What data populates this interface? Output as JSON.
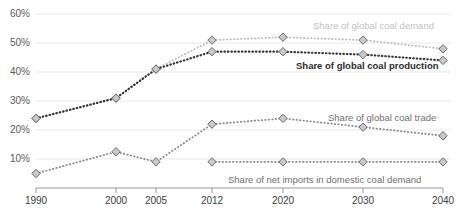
{
  "chart_data": {
    "type": "line",
    "title": "",
    "subtitle": "",
    "xlabel": "",
    "ylabel": "",
    "x": [
      "1990",
      "2000",
      "2005",
      "2012",
      "2020",
      "2030",
      "2040"
    ],
    "categories": [
      "1990",
      "2000",
      "2005",
      "2012",
      "2020",
      "2030",
      "2040"
    ],
    "ylim": [
      0,
      62
    ],
    "yticks": [
      10,
      20,
      30,
      40,
      50,
      60
    ],
    "ytick_labels": [
      "10%",
      "20%",
      "30%",
      "40%",
      "50%",
      "60%"
    ],
    "grid": "horizontal",
    "legend_position": "inline-annotations",
    "series": [
      {
        "name": "Share of global coal demand",
        "color": "#bfbfbf",
        "label_color": "#c2c2c2",
        "bold": false,
        "values": [
          24,
          31,
          41,
          51,
          52,
          51,
          48
        ],
        "x": [
          "1990",
          "2000",
          "2005",
          "2012",
          "2020",
          "2030",
          "2040"
        ]
      },
      {
        "name": "Share of global coal production",
        "color": "#333333",
        "label_color": "#2b2b2b",
        "bold": true,
        "values": [
          24,
          31,
          41,
          47,
          47,
          46,
          44
        ],
        "x": [
          "1990",
          "2000",
          "2005",
          "2012",
          "2020",
          "2030",
          "2040"
        ]
      },
      {
        "name": "Share of global coal trade",
        "color": "#8a8a8a",
        "label_color": "#6f6f6f",
        "bold": false,
        "values": [
          5,
          12.5,
          9,
          22,
          24,
          21,
          18
        ],
        "x": [
          "1990",
          "2000",
          "2005",
          "2012",
          "2020",
          "2030",
          "2040"
        ]
      },
      {
        "name": "Share of net imports in domestic coal demand",
        "color": "#8a8a8a",
        "label_color": "#6f6f6f",
        "bold": false,
        "values": [
          9,
          9,
          9,
          9
        ],
        "x": [
          "2012",
          "2020",
          "2030",
          "2040"
        ]
      }
    ],
    "marker": "diamond",
    "marker_fill": "#c9c9c9",
    "marker_stroke": "#6b6b6b",
    "line_style": "dotted"
  },
  "axis": {
    "y_labels": [
      "60%",
      "50%",
      "40%",
      "30%",
      "20%",
      "10%"
    ],
    "x_labels": [
      "1990",
      "2000",
      "2005",
      "2012",
      "2020",
      "2030",
      "2040"
    ]
  },
  "annotations": {
    "demand": "Share of global coal demand",
    "production": "Share of global coal production",
    "trade": "Share of global coal trade",
    "net_imports": "Share of net imports in domestic coal demand"
  }
}
